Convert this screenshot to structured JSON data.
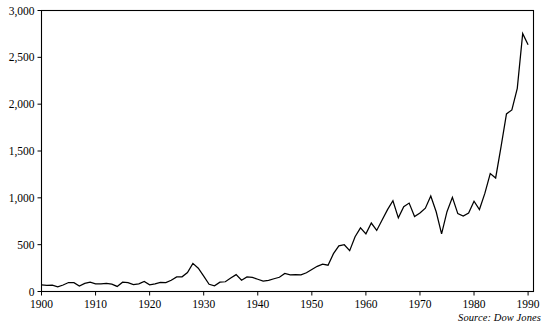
{
  "figure": {
    "source_note": "Source: Dow Jones",
    "caption": ""
  },
  "chart_data": {
    "type": "line",
    "title": "",
    "subtitle": "",
    "xlabel": "",
    "ylabel": "",
    "xlim": [
      1900,
      1991
    ],
    "ylim": [
      0,
      3000
    ],
    "grid": false,
    "legend": null,
    "annotations": [
      "Source: Dow Jones"
    ],
    "yticks": [
      0,
      500,
      1000,
      1500,
      2000,
      2500,
      3000
    ],
    "ytick_labels": [
      "0",
      "500",
      "1,000",
      "1,500",
      "2,000",
      "2,500",
      "3,000"
    ],
    "xticks": [
      1900,
      1910,
      1920,
      1930,
      1940,
      1950,
      1960,
      1970,
      1980,
      1990
    ],
    "xtick_labels": [
      "1900",
      "1910",
      "1920",
      "1930",
      "1940",
      "1950",
      "1960",
      "1970",
      "1980",
      "1990"
    ],
    "series": [
      {
        "name": "Dow Jones Industrial Average",
        "x": [
          1900,
          1901,
          1902,
          1903,
          1904,
          1905,
          1906,
          1907,
          1908,
          1909,
          1910,
          1911,
          1912,
          1913,
          1914,
          1915,
          1916,
          1917,
          1918,
          1919,
          1920,
          1921,
          1922,
          1923,
          1924,
          1925,
          1926,
          1927,
          1928,
          1929,
          1930,
          1931,
          1932,
          1933,
          1934,
          1935,
          1936,
          1937,
          1938,
          1939,
          1940,
          1941,
          1942,
          1943,
          1944,
          1945,
          1946,
          1947,
          1948,
          1949,
          1950,
          1951,
          1952,
          1953,
          1954,
          1955,
          1956,
          1957,
          1958,
          1959,
          1960,
          1961,
          1962,
          1963,
          1964,
          1965,
          1966,
          1967,
          1968,
          1969,
          1970,
          1971,
          1972,
          1973,
          1974,
          1975,
          1976,
          1977,
          1978,
          1979,
          1980,
          1981,
          1982,
          1983,
          1984,
          1985,
          1986,
          1987,
          1988,
          1989,
          1990
        ],
        "values": [
          70,
          65,
          67,
          49,
          69,
          96,
          94,
          58,
          86,
          99,
          82,
          81,
          87,
          78,
          54,
          99,
          95,
          74,
          82,
          107,
          72,
          81,
          98,
          95,
          120,
          156,
          157,
          202,
          300,
          248,
          164,
          77,
          60,
          99,
          104,
          144,
          180,
          121,
          155,
          150,
          131,
          111,
          119,
          136,
          152,
          193,
          177,
          181,
          177,
          200,
          235,
          269,
          292,
          281,
          404,
          488,
          499,
          436,
          584,
          679,
          616,
          731,
          652,
          763,
          874,
          969,
          786,
          905,
          944,
          800,
          839,
          890,
          1020,
          851,
          616,
          852,
          1005,
          831,
          805,
          838,
          964,
          875,
          1047,
          1259,
          1212,
          1547,
          1896,
          1939,
          2169,
          2753,
          2634
        ]
      }
    ]
  }
}
